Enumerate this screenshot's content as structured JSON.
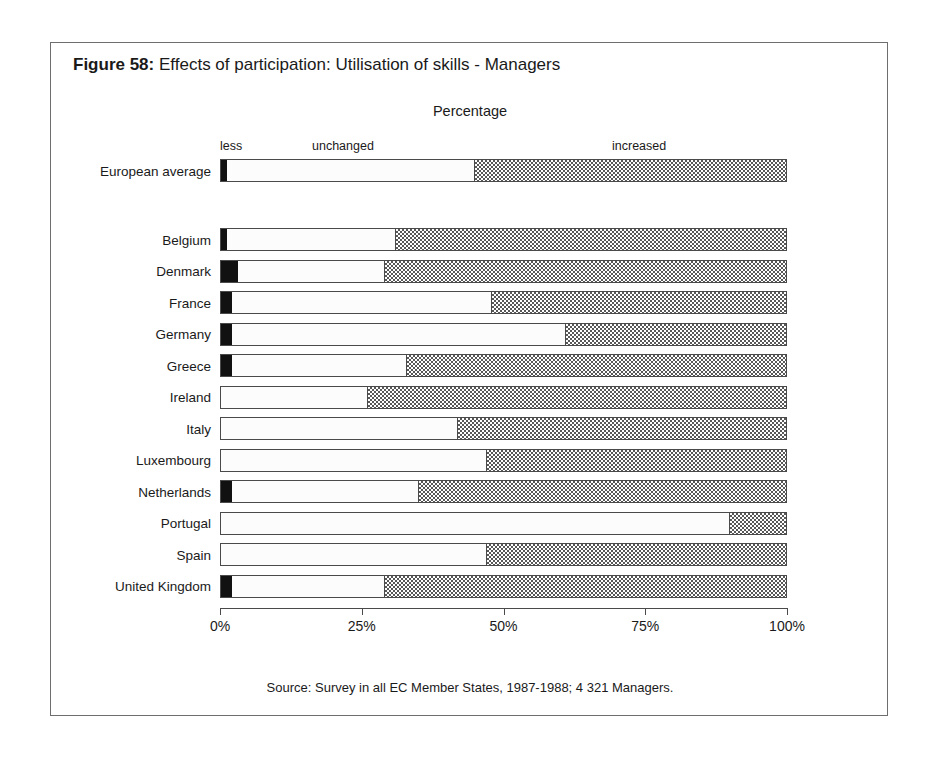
{
  "figure": {
    "number_label": "Figure 58:",
    "title": "Effects of participation: Utilisation of skills - Managers",
    "source": "Source: Survey in all EC Member States, 1987-1988; 4 321 Managers."
  },
  "legend": {
    "items": [
      {
        "key": "less",
        "label": "less",
        "color": "#111111"
      },
      {
        "key": "unchanged",
        "label": "unchanged",
        "color": "#fcfcfc"
      },
      {
        "key": "increased",
        "label": "increased",
        "color": "#585858"
      }
    ]
  },
  "axis": {
    "title": "Percentage",
    "ticks": [
      "0%",
      "25%",
      "50%",
      "75%",
      "100%"
    ],
    "tick_values": [
      0,
      25,
      50,
      75,
      100
    ],
    "min": 0,
    "max": 100
  },
  "chart_data": {
    "type": "bar",
    "orientation": "horizontal",
    "stacked": true,
    "normalized": true,
    "title": "Effects of participation: Utilisation of skills - Managers",
    "xlabel": "Percentage",
    "ylabel": "",
    "xlim": [
      0,
      100
    ],
    "grid": false,
    "legend_position": "top",
    "series": [
      {
        "name": "less",
        "values": [
          1,
          1,
          3,
          2,
          2,
          2,
          0,
          0,
          0,
          2,
          0,
          0,
          2
        ]
      },
      {
        "name": "unchanged",
        "values": [
          44,
          30,
          26,
          46,
          59,
          31,
          26,
          42,
          47,
          33,
          90,
          47,
          27
        ]
      },
      {
        "name": "increased",
        "values": [
          55,
          69,
          71,
          52,
          39,
          67,
          74,
          58,
          53,
          65,
          10,
          53,
          71
        ]
      }
    ],
    "categories": [
      "European average",
      "Belgium",
      "Denmark",
      "France",
      "Germany",
      "Greece",
      "Ireland",
      "Italy",
      "Luxembourg",
      "Netherlands",
      "Portugal",
      "Spain",
      "United Kingdom"
    ],
    "rows": [
      {
        "label": "European average",
        "less": 1,
        "unchanged": 44,
        "increased": 55,
        "group": "average"
      },
      {
        "label": "Belgium",
        "less": 1,
        "unchanged": 30,
        "increased": 69,
        "group": "country"
      },
      {
        "label": "Denmark",
        "less": 3,
        "unchanged": 26,
        "increased": 71,
        "group": "country"
      },
      {
        "label": "France",
        "less": 2,
        "unchanged": 46,
        "increased": 52,
        "group": "country"
      },
      {
        "label": "Germany",
        "less": 2,
        "unchanged": 59,
        "increased": 39,
        "group": "country"
      },
      {
        "label": "Greece",
        "less": 2,
        "unchanged": 31,
        "increased": 67,
        "group": "country"
      },
      {
        "label": "Ireland",
        "less": 0,
        "unchanged": 26,
        "increased": 74,
        "group": "country"
      },
      {
        "label": "Italy",
        "less": 0,
        "unchanged": 42,
        "increased": 58,
        "group": "country"
      },
      {
        "label": "Luxembourg",
        "less": 0,
        "unchanged": 47,
        "increased": 53,
        "group": "country"
      },
      {
        "label": "Netherlands",
        "less": 2,
        "unchanged": 33,
        "increased": 65,
        "group": "country"
      },
      {
        "label": "Portugal",
        "less": 0,
        "unchanged": 90,
        "increased": 10,
        "group": "country"
      },
      {
        "label": "Spain",
        "less": 0,
        "unchanged": 47,
        "increased": 53,
        "group": "country"
      },
      {
        "label": "United Kingdom",
        "less": 2,
        "unchanged": 27,
        "increased": 71,
        "group": "country"
      }
    ]
  }
}
